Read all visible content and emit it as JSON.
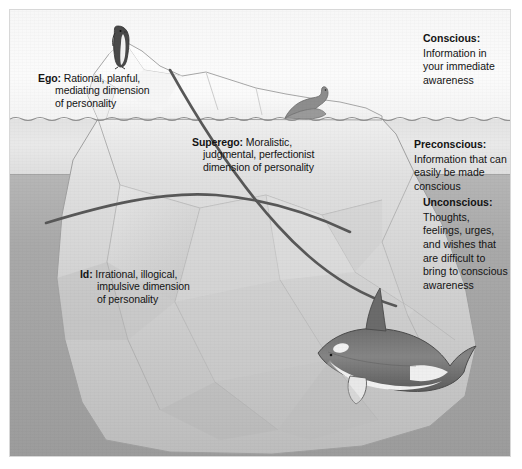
{
  "figure": {
    "type": "diagram"
  },
  "bands": [
    {
      "key": "conscious",
      "name": "Conscious",
      "fill": "#f8f8f8"
    },
    {
      "key": "preconscious",
      "name": "Preconscious",
      "fill": "#e4e4e4"
    },
    {
      "key": "unconscious",
      "name": "Unconscious",
      "fill": "#a7a7a7"
    }
  ],
  "structural_labels": {
    "ego": {
      "head": "Ego:",
      "line1": "Rational, planful,",
      "line2": "mediating dimension",
      "line3": "of personality"
    },
    "superego": {
      "head": "Superego:",
      "line1": "Moralistic,",
      "line2": "judgmental, perfectionist",
      "line3": "dimension of personality"
    },
    "id": {
      "head": "Id:",
      "line1": "Irrational, illogical,",
      "line2": "impulsive dimension",
      "line3": "of personality"
    }
  },
  "awareness_labels": {
    "conscious": {
      "head": "Conscious:",
      "line1": "Information in",
      "line2": "your immediate",
      "line3": "awareness"
    },
    "preconscious": {
      "head": "Preconscious:",
      "line1": "Information that can",
      "line2": "easily be made conscious"
    },
    "unconscious": {
      "head": "Unconscious:",
      "line1": "Thoughts,",
      "line2": "feelings, urges,",
      "line3": "and wishes that",
      "line4": "are difficult to",
      "line5": "bring to conscious",
      "line6": "awareness"
    }
  },
  "artwork": {
    "iceberg": "iceberg",
    "penguin": "penguin",
    "seal": "seal",
    "orca": "orca-whale",
    "waterline": "waterline"
  },
  "colors": {
    "ink": "#141414",
    "divider": "#5a5a5a",
    "hairline": "#9a9a9a",
    "sky": "#f8f8f8",
    "shallow_water": "#e4e4e4",
    "deep_water": "#a7a7a7"
  }
}
